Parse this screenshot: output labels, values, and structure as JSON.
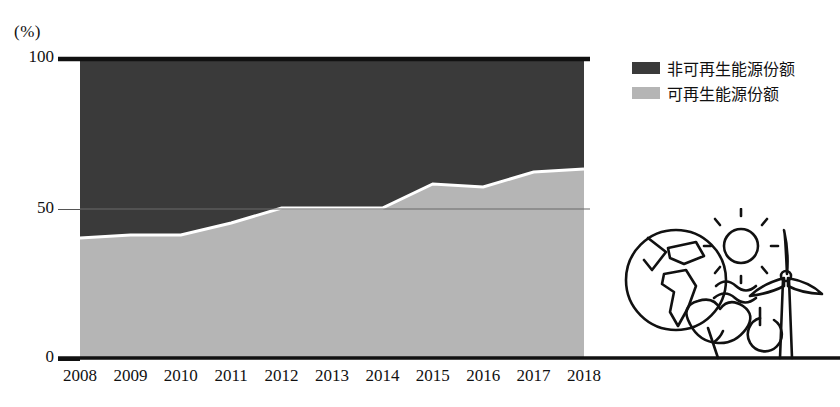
{
  "axis": {
    "unit_label": "(%)",
    "y_ticks": [
      "100",
      "50",
      "0"
    ],
    "x_ticks": [
      "2008",
      "2009",
      "2010",
      "2011",
      "2012",
      "2013",
      "2014",
      "2015",
      "2016",
      "2017",
      "2018"
    ]
  },
  "legend": {
    "items": [
      {
        "label": "非可再生能源份额",
        "color": "#3a3a3a"
      },
      {
        "label": "可再生能源份额",
        "color": "#b5b5b5"
      }
    ]
  },
  "colors": {
    "non_renewable": "#3a3a3a",
    "renewable": "#b5b5b5",
    "axis": "#111111",
    "gridline": "#6b6b6b",
    "boundary": "#ffffff"
  },
  "illustration": {
    "name": "renewable-energy-illustration",
    "elements": [
      "globe-icon",
      "sun-icon",
      "wind-turbine-icon",
      "leaf-icon",
      "power-icon",
      "water-waves-icon"
    ]
  },
  "chart_data": {
    "type": "area",
    "title": "",
    "subtitle": "",
    "xlabel": "",
    "ylabel": "(%)",
    "ylim": [
      0,
      100
    ],
    "y_tick_values": [
      0,
      50,
      100
    ],
    "grid": true,
    "stacked": true,
    "legend_position": "top-right",
    "x": [
      "2008",
      "2009",
      "2010",
      "2011",
      "2012",
      "2013",
      "2014",
      "2015",
      "2016",
      "2017",
      "2018"
    ],
    "categories": [
      "2008",
      "2009",
      "2010",
      "2011",
      "2012",
      "2013",
      "2014",
      "2015",
      "2016",
      "2017",
      "2018"
    ],
    "series": [
      {
        "name": "可再生能源份额",
        "color": "#b5b5b5",
        "values": [
          40,
          41,
          41,
          45,
          50,
          50,
          50,
          58,
          57,
          62,
          63
        ]
      },
      {
        "name": "非可再生能源份额",
        "color": "#3a3a3a",
        "values": [
          60,
          59,
          59,
          55,
          50,
          50,
          50,
          42,
          43,
          38,
          37
        ]
      }
    ],
    "annotations": []
  }
}
